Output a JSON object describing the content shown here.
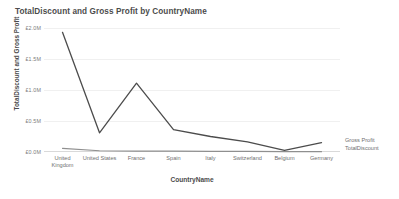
{
  "chart_data": {
    "type": "line",
    "title": "TotalDiscount and Gross Profit by CountryName",
    "xlabel": "CountryName",
    "ylabel": "TotalDiscount and Gross Profit",
    "categories": [
      "United Kingdom",
      "United States",
      "France",
      "Spain",
      "Italy",
      "Switzerland",
      "Belgium",
      "Germany"
    ],
    "series": [
      {
        "name": "Gross Profit",
        "color": "#4c4c4c",
        "values": [
          1930000,
          310000,
          1110000,
          360000,
          250000,
          165000,
          25000,
          150000
        ]
      },
      {
        "name": "TotalDiscount",
        "color": "#8f8f8f",
        "values": [
          60000,
          20000,
          15000,
          13000,
          11000,
          9000,
          7000,
          6000
        ]
      }
    ],
    "ylim": [
      0,
      2000000
    ],
    "yticks": [
      2000000,
      1500000,
      1000000,
      500000,
      0
    ],
    "ytick_labels": [
      "£2.0M",
      "£1.5M",
      "£1.0M",
      "£0.5M",
      "£0.0M"
    ],
    "grid": true,
    "legend_position": "right"
  },
  "legend": {
    "entries": [
      "Gross Profit",
      "TotalDiscount"
    ]
  }
}
